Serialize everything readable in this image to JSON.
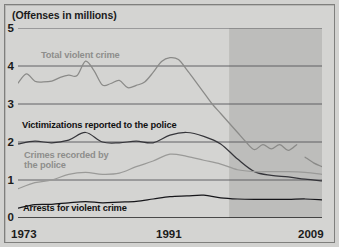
{
  "figure": {
    "axis_title": "(Offenses in millions)",
    "background_color": "#d4d4d2",
    "shaded_band_color": "#bdbdbb",
    "frame_color": "#7f7f7d"
  },
  "chart_data": {
    "type": "line",
    "title": "(Offenses in millions)",
    "xlabel": "",
    "ylabel": "Offenses in millions",
    "xlim": [
      1973,
      2009
    ],
    "ylim": [
      0,
      5
    ],
    "yticks": [
      0,
      1,
      2,
      3,
      4,
      5
    ],
    "ytick_labels": [
      "0",
      "1",
      "2",
      "3",
      "4",
      "5"
    ],
    "xticks": [
      1973,
      1975,
      1977,
      1979,
      1981,
      1983,
      1985,
      1987,
      1989,
      1991,
      1993,
      1995,
      1997,
      1999,
      2001,
      2003,
      2005,
      2007,
      2009
    ],
    "xtick_labels_shown": [
      "1973",
      "1991",
      "2009"
    ],
    "grid": "horizontal",
    "legend": "inline-annotations",
    "shaded_region": {
      "x_start": 1998,
      "x_end": 2009,
      "color": "#bdbdbb"
    },
    "series": [
      {
        "name": "Total violent crime",
        "color": "#8a8a88",
        "label_color": "#8e8e8c",
        "x": [
          1973,
          1974,
          1975,
          1976,
          1977,
          1978,
          1979,
          1980,
          1981,
          1982,
          1983,
          1984,
          1985,
          1986,
          1987,
          1988,
          1989,
          1990,
          1991,
          1992,
          1993,
          1994,
          1995,
          1996,
          1997,
          1998,
          1999,
          2000,
          2001,
          2002,
          2003,
          2004,
          2005,
          2006
        ],
        "values": [
          3.55,
          3.79,
          3.6,
          3.58,
          3.6,
          3.7,
          3.76,
          3.75,
          4.13,
          3.88,
          3.5,
          3.54,
          3.62,
          3.43,
          3.49,
          3.58,
          3.83,
          4.12,
          4.22,
          4.17,
          3.9,
          3.6,
          3.3,
          3.0,
          2.75,
          2.5,
          2.25,
          2.0,
          1.8,
          1.93,
          1.82,
          1.93,
          1.78,
          1.93
        ],
        "break_after": 2006,
        "x2": [
          2007,
          2008,
          2009
        ],
        "values2": [
          1.6,
          1.45,
          1.35
        ]
      },
      {
        "name": "Victimizations reported to the police",
        "color": "#35353a",
        "label_color": "#111111",
        "x": [
          1973,
          1975,
          1977,
          1979,
          1981,
          1983,
          1985,
          1987,
          1989,
          1991,
          1993,
          1995,
          1997,
          1999,
          2001,
          2003,
          2005,
          2007,
          2009
        ],
        "values": [
          1.95,
          2.02,
          1.98,
          2.05,
          2.25,
          2.0,
          1.98,
          2.02,
          1.98,
          2.18,
          2.25,
          2.15,
          1.95,
          1.55,
          1.22,
          1.12,
          1.08,
          1.02,
          0.98
        ]
      },
      {
        "name": "Crimes recorded by the police",
        "color": "#9a9a98",
        "label_color": "#8e8e8c",
        "x": [
          1973,
          1975,
          1977,
          1979,
          1981,
          1983,
          1985,
          1987,
          1989,
          1991,
          1993,
          1995,
          1997,
          1999,
          2001,
          2003,
          2005,
          2007,
          2009
        ],
        "values": [
          0.77,
          0.93,
          1.0,
          1.15,
          1.2,
          1.15,
          1.18,
          1.35,
          1.5,
          1.68,
          1.62,
          1.52,
          1.42,
          1.27,
          1.22,
          1.22,
          1.22,
          1.2,
          1.15
        ]
      },
      {
        "name": "Arrests for violent crime",
        "color": "#16161a",
        "label_color": "#111111",
        "x": [
          1973,
          1975,
          1977,
          1979,
          1981,
          1983,
          1985,
          1987,
          1989,
          1991,
          1993,
          1995,
          1997,
          1999,
          2001,
          2003,
          2005,
          2007,
          2009
        ],
        "values": [
          0.26,
          0.35,
          0.36,
          0.4,
          0.43,
          0.4,
          0.42,
          0.44,
          0.5,
          0.56,
          0.58,
          0.6,
          0.53,
          0.5,
          0.49,
          0.49,
          0.49,
          0.5,
          0.48
        ]
      }
    ]
  },
  "y_axis": {
    "ticks": [
      {
        "label": "5",
        "value": 5
      },
      {
        "label": "4",
        "value": 4
      },
      {
        "label": "3",
        "value": 3
      },
      {
        "label": "2",
        "value": 2
      },
      {
        "label": "1",
        "value": 1
      },
      {
        "label": "0",
        "value": 0
      }
    ]
  },
  "x_axis": {
    "start_label": "1973",
    "mid_label": "1991",
    "end_label": "2009"
  },
  "annotations": {
    "total_violent_crime": "Total violent crime",
    "victimizations": "Victimizations reported to the police",
    "crimes_recorded_line1": "Crimes recorded by",
    "crimes_recorded_line2": "the police",
    "arrests": "Arrests for violent crime"
  }
}
